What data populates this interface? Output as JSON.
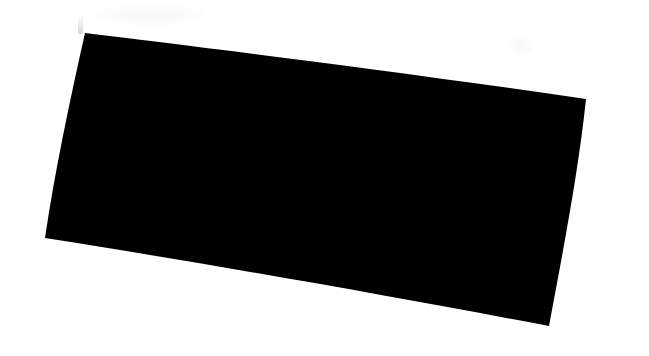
{
  "canvas": {
    "width": 649,
    "height": 356,
    "background_color": "#ffffff",
    "description": "Blank white screenshot canvas almost entirely covered by a solid black occlusion block"
  },
  "occlusion": {
    "label": "redaction-block",
    "fill_color": "#000000",
    "shape": "quadrilateral",
    "rotation_note": "rotated clockwise, edges slightly bowed, bottom-left corner ragged",
    "corners": {
      "top_left": {
        "x": 85,
        "y": 33
      },
      "top_right": {
        "x": 586,
        "y": 99
      },
      "bottom_right": {
        "x": 549,
        "y": 326
      },
      "bottom_left": {
        "x": 45,
        "y": 238
      }
    },
    "path": "M 85 33 C 200 47, 380 69, 586 99 C 578 175, 562 256, 549 326 C 390 296, 210 264, 45 238 C 55 170, 70 100, 85 33 Z"
  },
  "artifacts": [
    {
      "name": "smudge-top-left",
      "kind": "faint-gray-smudge",
      "color": "#f4f4f4",
      "x": 96,
      "y": 4,
      "width": 108,
      "height": 22
    },
    {
      "name": "smudge-top-right",
      "kind": "faint-gray-smudge",
      "color": "#fbfbfb",
      "x": 508,
      "y": 36,
      "width": 26,
      "height": 18
    },
    {
      "name": "smudge-streak",
      "kind": "thin-vertical-streak",
      "color": "#e8e8e8",
      "x": 78,
      "y": 14,
      "width": 5,
      "height": 20
    }
  ]
}
